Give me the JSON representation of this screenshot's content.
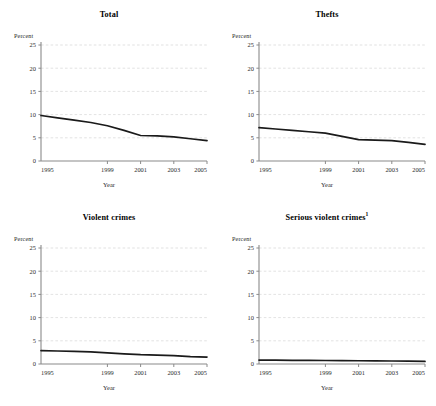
{
  "figure": {
    "kind": "small-multiples",
    "rows": 2,
    "columns": 2,
    "background": "#ffffff",
    "line_color": "#1a1a1a",
    "grid_color": "#cfcfcf",
    "axis_color": "#8a8a8a"
  },
  "chart_data": [
    {
      "type": "line",
      "title": "Total",
      "xlabel": "Year",
      "ylabel": "Percent",
      "x": [
        1995,
        1996,
        1997,
        1998,
        1999,
        2000,
        2001,
        2002,
        2003,
        2004,
        2005
      ],
      "xticks": [
        1995,
        1999,
        2001,
        2003,
        2005
      ],
      "xticklabels": [
        "1995",
        "1999",
        "2001",
        "2003",
        "2005"
      ],
      "yticks": [
        0,
        5,
        10,
        15,
        20,
        25
      ],
      "yticklabels": [
        "0",
        "5",
        "10",
        "15",
        "20",
        "25"
      ],
      "xlim": [
        1995,
        2005
      ],
      "ylim": [
        0,
        25
      ],
      "grid": true,
      "legend": "none",
      "series": [
        {
          "name": "Total",
          "values": [
            9.8,
            9.3,
            8.8,
            8.3,
            7.6,
            6.6,
            5.5,
            5.4,
            5.2,
            4.8,
            4.4
          ]
        }
      ]
    },
    {
      "type": "line",
      "title": "Thefts",
      "xlabel": "Year",
      "ylabel": "Percent",
      "x": [
        1995,
        1996,
        1997,
        1998,
        1999,
        2000,
        2001,
        2002,
        2003,
        2004,
        2005
      ],
      "xticks": [
        1995,
        1999,
        2001,
        2003,
        2005
      ],
      "xticklabels": [
        "1995",
        "1999",
        "2001",
        "2003",
        "2005"
      ],
      "yticks": [
        0,
        5,
        10,
        15,
        20,
        25
      ],
      "yticklabels": [
        "0",
        "5",
        "10",
        "15",
        "20",
        "25"
      ],
      "xlim": [
        1995,
        2005
      ],
      "ylim": [
        0,
        25
      ],
      "grid": true,
      "legend": "none",
      "series": [
        {
          "name": "Thefts",
          "values": [
            7.2,
            6.9,
            6.6,
            6.3,
            6.0,
            5.3,
            4.6,
            4.5,
            4.4,
            4.0,
            3.6
          ]
        }
      ]
    },
    {
      "type": "line",
      "title": "Violent crimes",
      "xlabel": "Year",
      "ylabel": "Percent",
      "x": [
        1995,
        1996,
        1997,
        1998,
        1999,
        2000,
        2001,
        2002,
        2003,
        2004,
        2005
      ],
      "xticks": [
        1995,
        1999,
        2001,
        2003,
        2005
      ],
      "xticklabels": [
        "1995",
        "1999",
        "2001",
        "2003",
        "2005"
      ],
      "yticks": [
        0,
        5,
        10,
        15,
        20,
        25
      ],
      "yticklabels": [
        "0",
        "5",
        "10",
        "15",
        "20",
        "25"
      ],
      "xlim": [
        1995,
        2005
      ],
      "ylim": [
        0,
        25
      ],
      "grid": true,
      "legend": "none",
      "series": [
        {
          "name": "Violent crimes",
          "values": [
            2.9,
            2.8,
            2.7,
            2.6,
            2.4,
            2.2,
            2.0,
            1.9,
            1.8,
            1.6,
            1.5
          ]
        }
      ]
    },
    {
      "type": "line",
      "title": "Serious violent crimes",
      "title_superscript": "1",
      "xlabel": "Year",
      "ylabel": "Percent",
      "x": [
        1995,
        1996,
        1997,
        1998,
        1999,
        2000,
        2001,
        2002,
        2003,
        2004,
        2005
      ],
      "xticks": [
        1995,
        1999,
        2001,
        2003,
        2005
      ],
      "xticklabels": [
        "1995",
        "1999",
        "2001",
        "2003",
        "2005"
      ],
      "yticks": [
        0,
        5,
        10,
        15,
        20,
        25
      ],
      "yticklabels": [
        "0",
        "5",
        "10",
        "15",
        "20",
        "25"
      ],
      "xlim": [
        1995,
        2005
      ],
      "ylim": [
        0,
        25
      ],
      "grid": true,
      "legend": "none",
      "series": [
        {
          "name": "Serious violent crimes",
          "values": [
            0.85,
            0.82,
            0.8,
            0.78,
            0.75,
            0.72,
            0.7,
            0.68,
            0.65,
            0.6,
            0.55
          ]
        }
      ]
    }
  ]
}
